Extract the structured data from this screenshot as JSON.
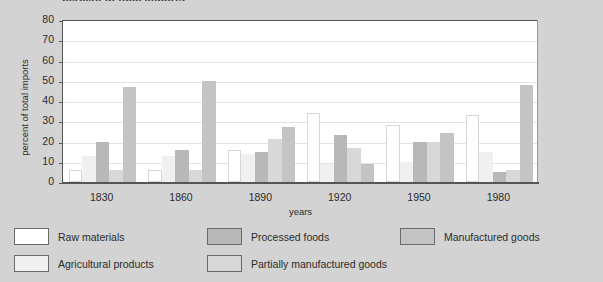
{
  "title_sliver": "percent of total imports",
  "axes": {
    "ylabel": "percent of total imports",
    "xlabel": "years",
    "yticks": [
      "0",
      "10",
      "20",
      "30",
      "40",
      "50",
      "60",
      "70",
      "80"
    ],
    "xticks": [
      "1830",
      "1860",
      "1890",
      "1920",
      "1950",
      "1980"
    ]
  },
  "legend": {
    "items": [
      {
        "label": "Raw materials",
        "color": "#ffffff"
      },
      {
        "label": "Agricultural products",
        "color": "#f0f0f0"
      },
      {
        "label": "Processed foods",
        "color": "#b8b8b8"
      },
      {
        "label": "Partially manufactured goods",
        "color": "#d8d8d8"
      },
      {
        "label": "Manufactured goods",
        "color": "#c4c4c4"
      }
    ]
  },
  "chart_data": {
    "type": "bar",
    "title": "percent of total imports",
    "xlabel": "years",
    "ylabel": "percent of total imports",
    "ylim": [
      0,
      80
    ],
    "grid": true,
    "legend_position": "bottom",
    "categories": [
      "1830",
      "1860",
      "1890",
      "1920",
      "1950",
      "1980"
    ],
    "series": [
      {
        "name": "Raw materials",
        "color": "#ffffff",
        "values": [
          6,
          6,
          16,
          34,
          28,
          33
        ]
      },
      {
        "name": "Agricultural products",
        "color": "#f0f0f0",
        "values": [
          13,
          13,
          14,
          9,
          10,
          15
        ]
      },
      {
        "name": "Processed foods",
        "color": "#b8b8b8",
        "values": [
          20,
          16,
          15,
          23,
          20,
          5
        ]
      },
      {
        "name": "Partially manufactured goods",
        "color": "#d8d8d8",
        "values": [
          6,
          6,
          21,
          17,
          20,
          6
        ]
      },
      {
        "name": "Manufactured goods",
        "color": "#c4c4c4",
        "values": [
          47,
          50,
          27,
          9,
          24,
          48
        ]
      }
    ]
  }
}
